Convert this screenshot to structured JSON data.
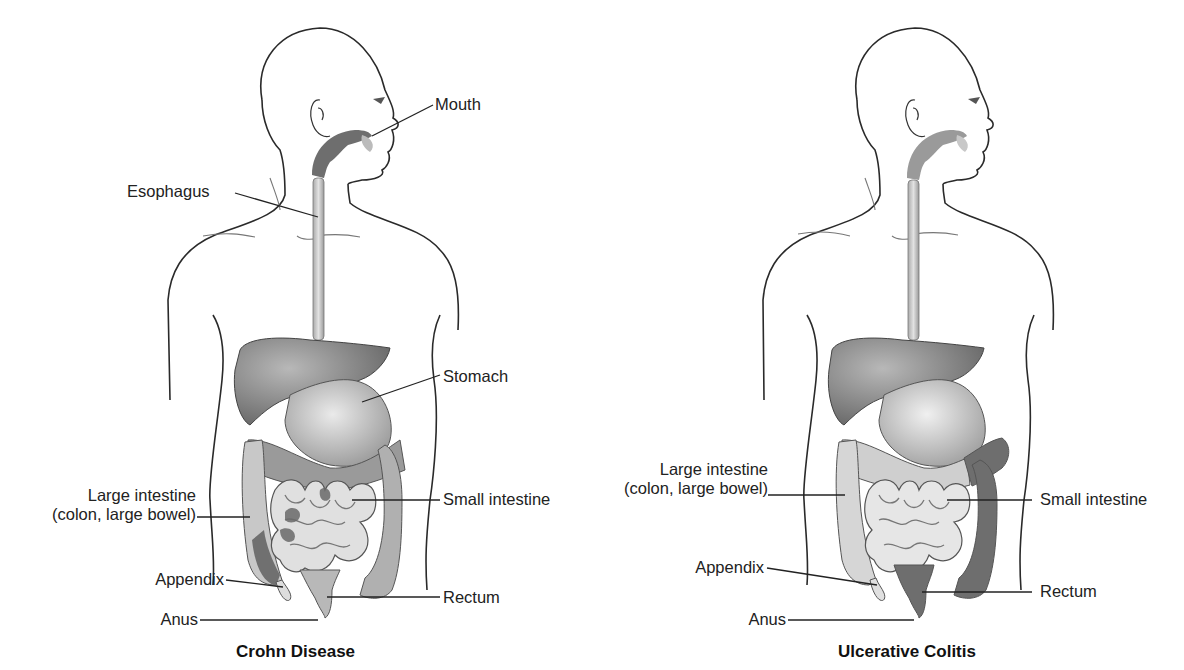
{
  "diagram": {
    "figures": [
      {
        "id": "crohn",
        "caption": "Crohn Disease",
        "labels": {
          "mouth": "Mouth",
          "esophagus": "Esophagus",
          "stomach": "Stomach",
          "large_intestine_line1": "Large intestine",
          "large_intestine_line2": "(colon, large bowel)",
          "small_intestine": "Small intestine",
          "appendix": "Appendix",
          "rectum": "Rectum",
          "anus": "Anus"
        }
      },
      {
        "id": "ulcerative-colitis",
        "caption": "Ulcerative Colitis",
        "labels": {
          "large_intestine_line1": "Large intestine",
          "large_intestine_line2": "(colon, large bowel)",
          "small_intestine": "Small intestine",
          "appendix": "Appendix",
          "rectum": "Rectum",
          "anus": "Anus"
        }
      }
    ],
    "colors": {
      "outline": "#2a2a2a",
      "affected_dark": "#6e6e6e",
      "healthy_light": "#d4d4d4",
      "liver": "#8a8a8a",
      "stomach": "#c9c9c9"
    }
  }
}
